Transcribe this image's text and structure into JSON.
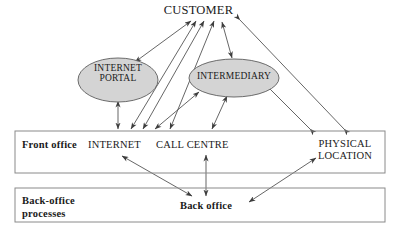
{
  "diagram": {
    "colors": {
      "ellipse_fill": "#d4d4d4",
      "stroke": "#4a4a4a",
      "box_stroke": "#8a8a8a",
      "text": "#1a1a1a"
    },
    "nodes": {
      "customer": {
        "label": "CUSTOMER",
        "shape": "text",
        "x": 205,
        "y": 11
      },
      "internet_portal": {
        "label_line1": "INTERNET",
        "label_line2": "PORTAL",
        "shape": "ellipse",
        "cx": 118,
        "cy": 80,
        "rx": 40,
        "ry": 22
      },
      "intermediary": {
        "label": "INTERMEDIARY",
        "shape": "ellipse",
        "cx": 234,
        "cy": 78,
        "rx": 45,
        "ry": 19
      },
      "front_office_box": {
        "label": "Front office",
        "x": 15,
        "y": 131,
        "w": 370,
        "h": 42
      },
      "internet": {
        "label": "INTERNET",
        "x": 118,
        "y": 146
      },
      "call_centre": {
        "label": "CALL CENTRE",
        "x": 197,
        "y": 146
      },
      "physical_location": {
        "label_line1": "PHYSICAL",
        "label_line2": "LOCATION",
        "x": 345,
        "y": 146
      },
      "back_office_box": {
        "label_line1": "Back-office",
        "label_line2": "processes",
        "x": 15,
        "y": 188,
        "w": 370,
        "h": 34
      },
      "back_office": {
        "label": "Back office",
        "x": 206,
        "y": 206
      }
    },
    "edges": [
      {
        "from": "internet_portal",
        "to": "customer",
        "arrows": "both"
      },
      {
        "from": "internet",
        "to": "customer",
        "arrows": "both"
      },
      {
        "from": "call_centre",
        "to": "customer",
        "arrows": "both"
      },
      {
        "from": "intermediary",
        "to": "customer",
        "arrows": "both"
      },
      {
        "from": "physical_location",
        "to": "customer",
        "arrows": "both"
      },
      {
        "from": "internet",
        "to": "internet_portal",
        "arrows": "both"
      },
      {
        "from": "internet",
        "to": "intermediary",
        "arrows": "both"
      },
      {
        "from": "call_centre",
        "to": "intermediary",
        "arrows": "both"
      },
      {
        "from": "physical_location",
        "to": "intermediary",
        "arrows": "both"
      },
      {
        "from": "internet",
        "to": "back_office",
        "arrows": "both"
      },
      {
        "from": "call_centre",
        "to": "back_office",
        "arrows": "both"
      },
      {
        "from": "physical_location",
        "to": "back_office",
        "arrows": "both"
      }
    ]
  }
}
